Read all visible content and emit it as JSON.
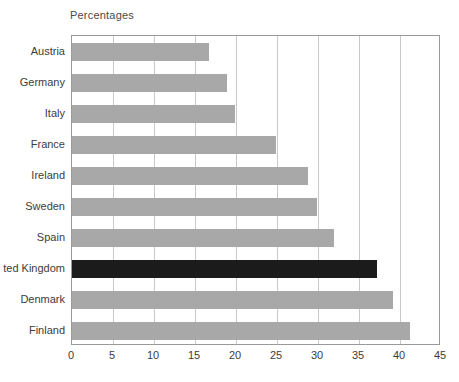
{
  "chart_data": {
    "type": "bar",
    "orientation": "horizontal",
    "title": "Percentages",
    "xlabel": "",
    "ylabel": "",
    "xlim": [
      0,
      45
    ],
    "xticks": [
      0,
      5,
      10,
      15,
      20,
      25,
      30,
      35,
      40,
      45
    ],
    "grid": true,
    "legend": "none",
    "categories": [
      "Austria",
      "Germany",
      "Italy",
      "France",
      "Ireland",
      "Sweden",
      "Spain",
      "ted Kingdom",
      "Denmark",
      "Finland"
    ],
    "values": [
      16.7,
      18.9,
      19.9,
      24.9,
      28.8,
      29.9,
      32.0,
      37.2,
      39.1,
      41.2
    ],
    "bar_colors": [
      "#a8a8a8",
      "#a8a8a8",
      "#a8a8a8",
      "#a8a8a8",
      "#a8a8a8",
      "#a8a8a8",
      "#a8a8a8",
      "#1b1b1b",
      "#a8a8a8",
      "#a8a8a8"
    ],
    "highlight_index": 7,
    "colors": {
      "bar": "#a8a8a8",
      "bar_highlight": "#1b1b1b",
      "gridline": "#c9c9c9",
      "axis_border": "#9a9a9a",
      "text": "#3c3c3c",
      "title_text": "#4a4a4a",
      "background": "#ffffff"
    }
  }
}
